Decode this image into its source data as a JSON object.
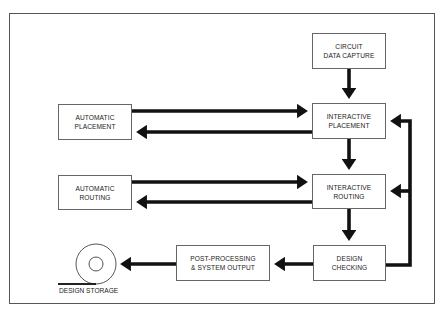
{
  "diagram": {
    "nodes": [
      {
        "id": "circuit-data-capture",
        "label": "CIRCUIT\nDATA CAPTURE"
      },
      {
        "id": "interactive-placement",
        "label": "INTERACTIVE\nPLACEMENT"
      },
      {
        "id": "automatic-placement",
        "label": "AUTOMATIC\nPLACEMENT"
      },
      {
        "id": "interactive-routing",
        "label": "INTERACTIVE\nROUTING"
      },
      {
        "id": "automatic-routing",
        "label": "AUTOMATIC\nROUTING"
      },
      {
        "id": "design-checking",
        "label": "DESIGN\nCHECKING"
      },
      {
        "id": "post-processing",
        "label": "POST-PROCESSING\n& SYSTEM OUTPUT"
      }
    ],
    "storage": {
      "label": "DESIGN STORAGE",
      "icon": "disc-icon"
    },
    "edges": [
      {
        "from": "circuit-data-capture",
        "to": "interactive-placement"
      },
      {
        "from": "automatic-placement",
        "to": "interactive-placement"
      },
      {
        "from": "interactive-placement",
        "to": "automatic-placement"
      },
      {
        "from": "interactive-placement",
        "to": "interactive-routing"
      },
      {
        "from": "automatic-routing",
        "to": "interactive-routing"
      },
      {
        "from": "interactive-routing",
        "to": "automatic-routing"
      },
      {
        "from": "interactive-routing",
        "to": "design-checking"
      },
      {
        "from": "design-checking",
        "to": "interactive-placement"
      },
      {
        "from": "design-checking",
        "to": "interactive-routing"
      },
      {
        "from": "design-checking",
        "to": "post-processing"
      },
      {
        "from": "post-processing",
        "to": "design-storage"
      }
    ]
  }
}
